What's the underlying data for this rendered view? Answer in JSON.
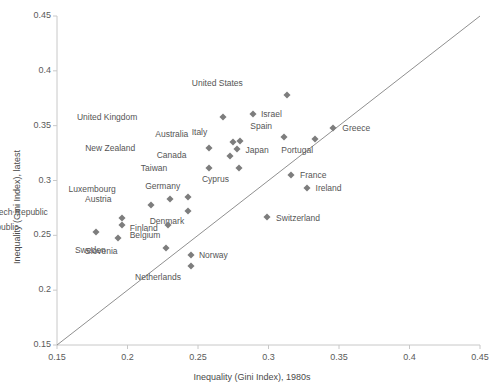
{
  "chart_data": {
    "type": "scatter",
    "title": "",
    "xlabel": "Inequality (Gini Index), 1980s",
    "ylabel": "Inequality (Gini Index), latest",
    "xlim": [
      0.15,
      0.45
    ],
    "ylim": [
      0.15,
      0.45
    ],
    "xticks": [
      "0.15",
      "0.2",
      "0.25",
      "0.3",
      "0.35",
      "0.4",
      "0.45"
    ],
    "yticks": [
      "0.15",
      "0.2",
      "0.25",
      "0.3",
      "0.35",
      "0.4",
      "0.45"
    ],
    "grid": false,
    "legend": "none",
    "reference_line": {
      "type": "identity",
      "from": [
        0.15,
        0.15
      ],
      "to": [
        0.45,
        0.45
      ]
    },
    "marker": {
      "shape": "diamond",
      "color": "#7d7d7d"
    },
    "points": [
      {
        "label": "United States",
        "x": 0.313,
        "y": 0.378,
        "lx": -44,
        "ly": -12
      },
      {
        "label": "Israel",
        "x": 0.289,
        "y": 0.361,
        "lx": 8,
        "ly": 0
      },
      {
        "label": "United Kingdom",
        "x": 0.268,
        "y": 0.358,
        "lx": -86,
        "ly": 0
      },
      {
        "label": "Greece",
        "x": 0.346,
        "y": 0.348,
        "lx": 9,
        "ly": 0
      },
      {
        "label": "Spain",
        "x": 0.311,
        "y": 0.34,
        "lx": -12,
        "ly": -11
      },
      {
        "label": "Australia",
        "x": 0.28,
        "y": 0.336,
        "lx": -52,
        "ly": -7
      },
      {
        "label": "Italy",
        "x": 0.275,
        "y": 0.335,
        "lx": -26,
        "ly": -10
      },
      {
        "label": "Portugal",
        "x": 0.333,
        "y": 0.338,
        "lx": -2,
        "ly": 11
      },
      {
        "label": "New Zealand",
        "x": 0.258,
        "y": 0.33,
        "lx": -74,
        "ly": 0
      },
      {
        "label": "Japan",
        "x": 0.278,
        "y": 0.329,
        "lx": 8,
        "ly": 1
      },
      {
        "label": "Canada",
        "x": 0.273,
        "y": 0.322,
        "lx": -44,
        "ly": -1
      },
      {
        "label": "Taiwan",
        "x": 0.258,
        "y": 0.311,
        "lx": -42,
        "ly": 0
      },
      {
        "label": "Cyprus",
        "x": 0.279,
        "y": 0.311,
        "lx": -10,
        "ly": 11
      },
      {
        "label": "France",
        "x": 0.316,
        "y": 0.305,
        "lx": 9,
        "ly": 0
      },
      {
        "label": "Ireland",
        "x": 0.327,
        "y": 0.293,
        "lx": 9,
        "ly": 0
      },
      {
        "label": "Germany",
        "x": 0.243,
        "y": 0.285,
        "lx": -8,
        "ly": -11
      },
      {
        "label": "Luxembourg",
        "x": 0.23,
        "y": 0.283,
        "lx": -54,
        "ly": -10
      },
      {
        "label": "Austria",
        "x": 0.217,
        "y": 0.278,
        "lx": -40,
        "ly": -6
      },
      {
        "label": "Denmark",
        "x": 0.243,
        "y": 0.272,
        "lx": -4,
        "ly": 10
      },
      {
        "label": "Czech Republic",
        "x": 0.196,
        "y": 0.266,
        "lx": -74,
        "ly": -6
      },
      {
        "label": "Switzerland",
        "x": 0.299,
        "y": 0.267,
        "lx": 9,
        "ly": 1
      },
      {
        "label": "Finland",
        "x": 0.196,
        "y": 0.259,
        "lx": 8,
        "ly": 3
      },
      {
        "label": "Belgium",
        "x": 0.229,
        "y": 0.259,
        "lx": -8,
        "ly": 10
      },
      {
        "label": "Slovak Republic",
        "x": 0.178,
        "y": 0.253,
        "lx": -78,
        "ly": -5
      },
      {
        "label": "Sweden",
        "x": 0.193,
        "y": 0.248,
        "lx": -12,
        "ly": 12
      },
      {
        "label": "Slovenia",
        "x": 0.227,
        "y": 0.238,
        "lx": -48,
        "ly": 3
      },
      {
        "label": "Norway",
        "x": 0.245,
        "y": 0.232,
        "lx": 8,
        "ly": 0
      },
      {
        "label": "Netherlands",
        "x": 0.245,
        "y": 0.222,
        "lx": -10,
        "ly": 11
      }
    ]
  }
}
